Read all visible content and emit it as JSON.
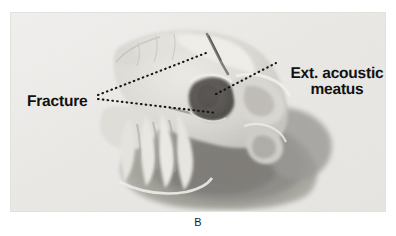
{
  "figure": {
    "letter": "B",
    "annotations": {
      "fracture": "Fracture",
      "meatus_line1": "Ext. acoustic",
      "meatus_line2": "meatus"
    },
    "colors": {
      "page_background": "#ffffff",
      "plate_background": "#ececeb",
      "label_text": "#111111",
      "leader_line": "#141414",
      "bone_light": "#e3e1dd",
      "bone_mid": "#c5c3bf",
      "bone_shadow": "#a2a09c",
      "soft_tissue_dark": "#8f8d8a",
      "meatus_dark": "#5a5755"
    }
  }
}
